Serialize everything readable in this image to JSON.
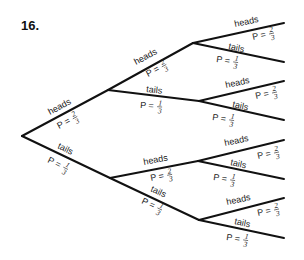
{
  "problem_number": "16.",
  "diagram_type": "probability tree",
  "outcome_labels": {
    "heads": "heads",
    "tails": "tails"
  },
  "probabilities": {
    "heads": {
      "label": "P =",
      "num": "2",
      "den": "3"
    },
    "tails": {
      "label": "P =",
      "num": "1",
      "den": "3"
    }
  },
  "levels": 3,
  "nodes": {
    "root": [
      22,
      136
    ],
    "h": [
      108,
      90
    ],
    "t": [
      110,
      178
    ],
    "hh": [
      193,
      43
    ],
    "ht": [
      199,
      101
    ],
    "th": [
      198,
      161
    ],
    "tt": [
      199,
      220
    ]
  },
  "leaves": {
    "hhh": [
      284,
      23
    ],
    "hht": [
      284,
      62
    ],
    "hth": [
      284,
      81
    ],
    "htt": [
      284,
      120
    ],
    "thh": [
      284,
      140
    ],
    "tht": [
      284,
      179
    ],
    "tth": [
      284,
      198
    ],
    "ttt": [
      284,
      238
    ]
  }
}
